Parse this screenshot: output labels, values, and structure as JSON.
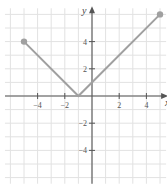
{
  "chart_data": {
    "type": "line",
    "title": "",
    "xlabel": "x",
    "ylabel": "y",
    "xlim": [
      -6,
      5
    ],
    "ylim": [
      -6,
      6
    ],
    "grid": true,
    "x_ticks": [
      -4,
      -2,
      2,
      4
    ],
    "y_ticks": [
      4,
      2,
      -2,
      -4
    ],
    "x_tick_labels": [
      "−4",
      "−2",
      "2",
      "4"
    ],
    "y_tick_labels": [
      "4",
      "2",
      "−2",
      "−4"
    ],
    "series": [
      {
        "name": "f(x)",
        "points": [
          [
            -5,
            4
          ],
          [
            -1,
            0
          ],
          [
            5,
            6
          ]
        ],
        "endpoints": [
          [
            -5,
            4
          ],
          [
            5,
            6
          ]
        ],
        "endpoint_style": "closed-dot"
      }
    ],
    "colors": {
      "line": "#a0a0a0",
      "grid": "#e2e2e2",
      "axis": "#555555",
      "text": "#555555"
    }
  }
}
